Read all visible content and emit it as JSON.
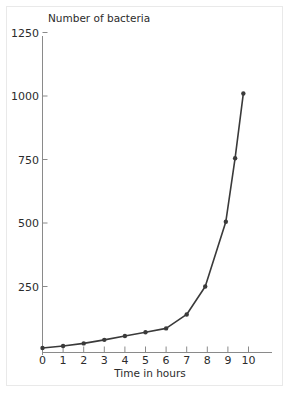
{
  "chart_data": {
    "type": "line",
    "title": "",
    "subtitle": "",
    "xlabel": "Time in hours",
    "ylabel": "Number of bacteria",
    "xlim": [
      0,
      11
    ],
    "ylim": [
      0,
      1250
    ],
    "grid": false,
    "legend": null,
    "legend_position": "none",
    "x_ticks": [
      0,
      1,
      2,
      3,
      4,
      5,
      6,
      7,
      8,
      9,
      10
    ],
    "x_tick_labels": [
      "0",
      "1",
      "2",
      "3",
      "4",
      "5",
      "6",
      "7",
      "8",
      "9",
      "10"
    ],
    "y_ticks": [
      250,
      500,
      750,
      1000,
      1250
    ],
    "y_tick_labels": [
      "250",
      "500",
      "750",
      "1000",
      "1250"
    ],
    "marker": "circle",
    "line_color": "#3a3a3a",
    "marker_color": "#3a3a3a",
    "axis_color": "#8a8a8a",
    "text_color": "#2b2b2b",
    "background_color": "#ffffff",
    "border_color": "#e9e9e9",
    "series": [
      {
        "name": "Number of bacteria",
        "points": [
          {
            "x": 0.0,
            "y": 8
          },
          {
            "x": 1.0,
            "y": 16
          },
          {
            "x": 2.0,
            "y": 26
          },
          {
            "x": 3.0,
            "y": 40
          },
          {
            "x": 4.0,
            "y": 55
          },
          {
            "x": 5.0,
            "y": 70
          },
          {
            "x": 6.0,
            "y": 85
          },
          {
            "x": 7.0,
            "y": 140
          },
          {
            "x": 7.9,
            "y": 250
          },
          {
            "x": 8.9,
            "y": 505
          },
          {
            "x": 9.35,
            "y": 755
          },
          {
            "x": 9.75,
            "y": 1010
          }
        ]
      }
    ]
  },
  "figure": {
    "axis_label_y": "Number of bacteria",
    "axis_label_x": "Time in hours"
  }
}
